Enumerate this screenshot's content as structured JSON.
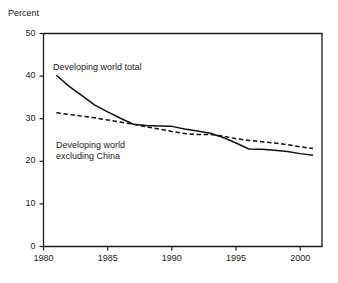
{
  "chart_data": {
    "type": "line",
    "title": "",
    "subtitle": "",
    "xlabel": "",
    "ylabel": "Percent",
    "xlim": [
      1980,
      2001.7
    ],
    "ylim": [
      0,
      50
    ],
    "grid": false,
    "legend_position": "inline-annotations",
    "xticks": [
      1980,
      1985,
      1990,
      1995,
      2000
    ],
    "xtick_labels": [
      "1980",
      "1985",
      "1990",
      "1995",
      "2000"
    ],
    "yticks": [
      0,
      10,
      20,
      30,
      40,
      50
    ],
    "ytick_labels": [
      "0",
      "10",
      "20",
      "30",
      "40",
      "50"
    ],
    "series": [
      {
        "name": "Developing world total",
        "style": "solid",
        "color": "#111111",
        "x": [
          1981,
          1982,
          1983,
          1984,
          1985,
          1986,
          1987,
          1988,
          1989,
          1990,
          1991,
          1992,
          1993,
          1994,
          1995,
          1996,
          1997,
          1998,
          1999,
          2000,
          2001
        ],
        "values": [
          40.2,
          37.6,
          35.4,
          33.2,
          31.6,
          30.1,
          28.7,
          28.4,
          28.3,
          28.2,
          27.6,
          27.1,
          26.6,
          25.6,
          24.3,
          22.9,
          22.8,
          22.6,
          22.3,
          21.8,
          21.4
        ]
      },
      {
        "name": "Developing world excluding China",
        "style": "dashed",
        "color": "#111111",
        "x": [
          1981,
          1982,
          1983,
          1984,
          1985,
          1986,
          1987,
          1988,
          1989,
          1990,
          1991,
          1992,
          1993,
          1994,
          1995,
          1996,
          1997,
          1998,
          1999,
          2000,
          2001
        ],
        "values": [
          31.4,
          31.0,
          30.6,
          30.2,
          29.7,
          29.2,
          28.7,
          28.1,
          27.6,
          27.0,
          26.5,
          26.3,
          26.3,
          25.9,
          25.3,
          24.9,
          24.6,
          24.3,
          23.9,
          23.4,
          23.0
        ]
      }
    ],
    "annotations": [
      {
        "id": "annotation-total",
        "text": "Developing world total",
        "x_px": 53,
        "y_px": 62
      },
      {
        "id": "annotation-excluding-china",
        "text": "Developing world\nexcluding China",
        "x_px": 56,
        "y_px": 140
      }
    ]
  },
  "axes": {
    "y_axis_title": "Percent"
  }
}
